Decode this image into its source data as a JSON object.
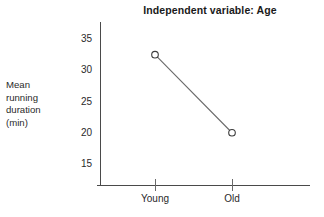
{
  "chart_data": {
    "type": "line",
    "title": "Independent variable: Age",
    "xlabel": "",
    "ylabel": "Mean running duration (min)",
    "ylabel_lines": [
      "Mean",
      "running",
      "duration",
      "(min)"
    ],
    "categories": [
      "Young",
      "Old"
    ],
    "values": [
      32.5,
      20.0
    ],
    "series": [
      {
        "name": "Mean running duration",
        "values": [
          32.5,
          20.0
        ]
      }
    ],
    "y_ticks": [
      35,
      30,
      25,
      20,
      15
    ],
    "ylim": [
      12.5,
      36.5
    ],
    "grid": false,
    "legend": false,
    "marker": "open-circle",
    "colors": {
      "line": "#6b6b6b",
      "marker_stroke": "#3c3c3c",
      "marker_fill": "#ffffff",
      "axis": "#4a4a4a",
      "text": "#1d1d1d",
      "background": "#ffffff"
    }
  },
  "axis": {
    "y_tick_labels": [
      "35",
      "30",
      "25",
      "20",
      "15"
    ],
    "x_tick_labels": [
      "Young",
      "Old"
    ]
  }
}
